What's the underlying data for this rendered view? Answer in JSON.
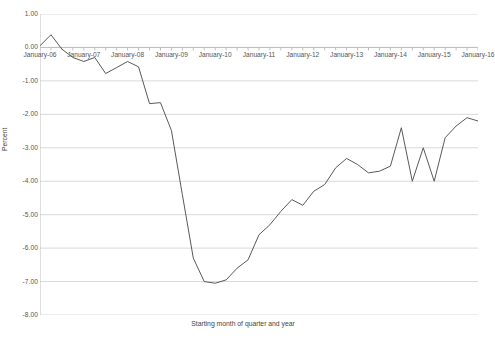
{
  "chart_data": {
    "type": "line",
    "title": "",
    "xlabel": "Starting month of quarter and year",
    "ylabel": "Percent",
    "ylim": [
      -8.0,
      1.0
    ],
    "ytick_step": 1.0,
    "yticks": [
      "1.00",
      "0.00",
      "-1.00",
      "-2.00",
      "-3.00",
      "-4.00",
      "-5.00",
      "-6.00",
      "-7.00",
      "-8.00"
    ],
    "ytick_values": [
      1.0,
      0.0,
      -1.0,
      -2.0,
      -3.0,
      -4.0,
      -5.0,
      -6.0,
      -7.0,
      -8.0
    ],
    "xtick_labels": [
      "January-06",
      "January-07",
      "January-08",
      "January-09",
      "January-10",
      "January-11",
      "January-12",
      "January-13",
      "January-14",
      "January-15",
      "January-16"
    ],
    "xtick_values": [
      0,
      4,
      8,
      12,
      16,
      20,
      24,
      28,
      32,
      36,
      40
    ],
    "x_minor_ticks_per_label": 4,
    "grid": true,
    "grid_axis": "y",
    "grid_color": "#d9d9d9",
    "legend": false,
    "line_color": "#595959",
    "line_width": 1.0,
    "plot_border": false,
    "x_points": [
      0,
      1,
      2,
      3,
      4,
      5,
      6,
      7,
      8,
      9,
      10,
      11,
      12,
      13,
      14,
      15,
      16,
      17,
      18,
      19,
      20,
      21,
      22,
      23,
      24,
      25,
      26,
      27,
      28,
      29,
      30,
      31,
      32,
      33,
      34,
      35,
      36,
      37,
      38,
      39,
      40
    ],
    "x_point_labels": [
      "January-06",
      "April-06",
      "July-06",
      "October-06",
      "January-07",
      "April-07",
      "July-07",
      "October-07",
      "January-08",
      "April-08",
      "July-08",
      "October-08",
      "January-09",
      "April-09",
      "July-09",
      "October-09",
      "January-10",
      "April-10",
      "July-10",
      "October-10",
      "January-11",
      "April-11",
      "July-11",
      "October-11",
      "January-12",
      "April-12",
      "July-12",
      "October-12",
      "January-13",
      "April-13",
      "July-13",
      "October-13",
      "January-14",
      "April-14",
      "July-14",
      "October-14",
      "January-15",
      "April-15",
      "July-15",
      "October-15",
      "January-16"
    ],
    "values": [
      0.05,
      0.38,
      -0.05,
      -0.3,
      -0.42,
      -0.3,
      -0.78,
      -0.6,
      -0.42,
      -0.58,
      -1.68,
      -1.65,
      -2.48,
      -4.4,
      -6.3,
      -7.0,
      -7.05,
      -6.95,
      -6.6,
      -6.35,
      -5.6,
      -5.3,
      -4.9,
      -4.55,
      -4.72,
      -4.3,
      -4.1,
      -3.6,
      -3.32,
      -3.5,
      -3.75,
      -3.7,
      -3.55,
      -2.4,
      -4.0,
      -3.0,
      -4.0,
      -2.7,
      -2.35,
      -2.1,
      -2.2
    ],
    "series": [
      {
        "name": "Percent",
        "values": [
          0.05,
          0.38,
          -0.05,
          -0.3,
          -0.42,
          -0.3,
          -0.78,
          -0.6,
          -0.42,
          -0.58,
          -1.68,
          -1.65,
          -2.48,
          -4.4,
          -6.3,
          -7.0,
          -7.05,
          -6.95,
          -6.6,
          -6.35,
          -5.6,
          -5.3,
          -4.9,
          -4.55,
          -4.72,
          -4.3,
          -4.1,
          -3.6,
          -3.32,
          -3.5,
          -3.75,
          -3.7,
          -3.55,
          -2.4,
          -4.0,
          -3.0,
          -4.0,
          -2.7,
          -2.35,
          -2.1,
          -2.2
        ]
      }
    ],
    "annotations": {
      "max_value": 0.38,
      "max_label": "April-06",
      "min_value": -7.05,
      "min_label": "January-10",
      "final_value": -2.2,
      "final_label": "January-16"
    }
  }
}
